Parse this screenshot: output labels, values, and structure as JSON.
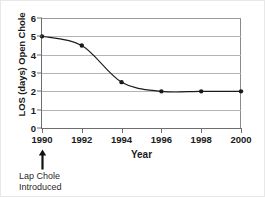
{
  "chart_data": {
    "type": "line",
    "title": "",
    "xlabel": "Year",
    "ylabel": "LOS (days) Open Chole",
    "x": [
      1990,
      1992,
      1994,
      1996,
      1998,
      2000
    ],
    "values": [
      5.0,
      4.5,
      2.5,
      2.0,
      2.0,
      2.0
    ],
    "series": [
      {
        "name": "LOS (days) Open Chole",
        "values": [
          5.0,
          4.5,
          2.5,
          2.0,
          2.0,
          2.0
        ]
      }
    ],
    "xlim": [
      1990,
      2000
    ],
    "ylim": [
      0,
      6
    ],
    "ytick_labels": [
      "0",
      "1",
      "2",
      "3",
      "4",
      "5",
      "6"
    ],
    "ytick_values": [
      0,
      1,
      2,
      3,
      4,
      5,
      6
    ],
    "xtick_labels": [
      "1990",
      "1992",
      "1994",
      "1996",
      "1998",
      "2000"
    ],
    "xtick_values": [
      1990,
      1992,
      1994,
      1996,
      1998,
      2000
    ],
    "grid": "horizontal",
    "legend": "none",
    "marker": "filled-circle",
    "line_color": "#1a1a1a",
    "grid_color": "#b4b4b4",
    "axis_color": "#6e6e6e",
    "annotations": [
      {
        "name": "lap-chole-introduced",
        "line1": "Lap Chole",
        "line2": "Introduced",
        "points_at": 1990,
        "arrow": "up-arrow-icon"
      }
    ]
  },
  "axis": {
    "y_title": "LOS (days) Open Chole",
    "x_title": "Year"
  }
}
